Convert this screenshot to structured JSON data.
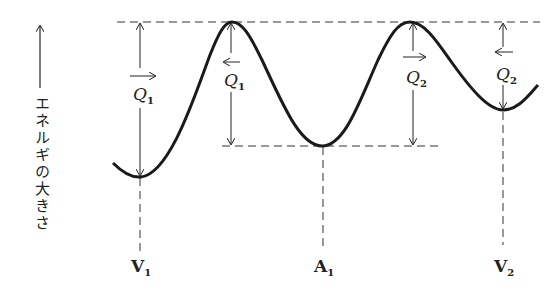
{
  "diagram": {
    "type": "potential-energy-curve",
    "axis_label": "エネルギの大きさ",
    "points": {
      "V1": {
        "label": "V",
        "sub": "1"
      },
      "A1": {
        "label": "A",
        "sub": "1"
      },
      "V2": {
        "label": "V",
        "sub": "2"
      }
    },
    "barriers": [
      {
        "label": "Q",
        "sub": "1",
        "direction": "right"
      },
      {
        "label": "Q",
        "sub": "1",
        "direction": "left"
      },
      {
        "label": "Q",
        "sub": "2",
        "direction": "right"
      },
      {
        "label": "Q",
        "sub": "2",
        "direction": "left"
      }
    ],
    "colors": {
      "line": "#222222",
      "background": "#ffffff"
    }
  }
}
